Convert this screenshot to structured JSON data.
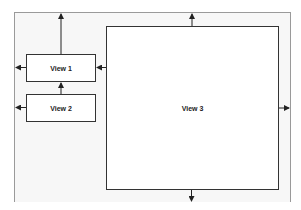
{
  "diagram": {
    "type": "layout-constraints",
    "views": [
      {
        "id": "view1",
        "label": "View 1"
      },
      {
        "id": "view2",
        "label": "View 2"
      },
      {
        "id": "view3",
        "label": "View 3"
      }
    ],
    "arrows": [
      {
        "from": "view1",
        "direction": "up",
        "to": "container-top"
      },
      {
        "from": "view1",
        "direction": "left",
        "to": "container-left"
      },
      {
        "from": "view3",
        "direction": "left",
        "to": "view1"
      },
      {
        "from": "view2",
        "direction": "up",
        "to": "view1"
      },
      {
        "from": "view2",
        "direction": "left",
        "to": "container-left"
      },
      {
        "from": "view3",
        "direction": "up",
        "to": "container-top"
      },
      {
        "from": "view3",
        "direction": "right",
        "to": "container-right"
      },
      {
        "from": "view3",
        "direction": "down",
        "to": "container-bottom"
      }
    ],
    "colors": {
      "frame": "#9a9a9a",
      "frame_fill": "#f7f7f7",
      "box_border": "#333333",
      "arrow": "#222222"
    }
  }
}
